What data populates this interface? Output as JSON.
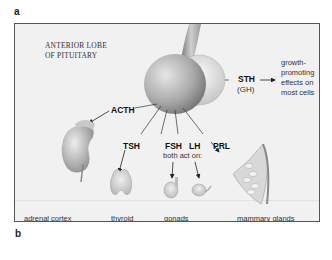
{
  "figure": {
    "panel_labels": {
      "top": "a",
      "bottom": "b"
    },
    "title_line1": "ANTERIOR LOBE",
    "title_line2": "OF PITUITARY",
    "hormones": {
      "acth": "ACTH",
      "tsh": "TSH",
      "fsh": "FSH",
      "lh": "LH",
      "prl": "PRL",
      "sth": "STH",
      "gh": "(GH)"
    },
    "gonad_note": "both act on:",
    "sth_effect": [
      "growth-",
      "promoting",
      "effects on",
      "most cells"
    ],
    "targets": [
      "adrenal cortex",
      "thyroid",
      "gonads",
      "mammary glands"
    ],
    "colors": {
      "frame_bg": "#f1f1f1",
      "frame_border": "#555555",
      "gland": "#9a9a9a",
      "text": "#222222"
    }
  }
}
